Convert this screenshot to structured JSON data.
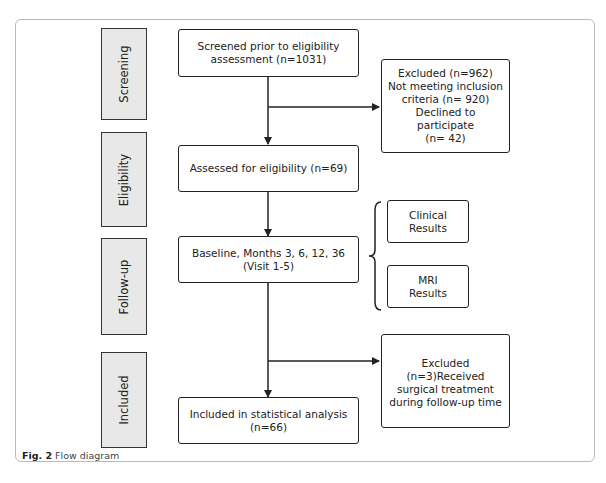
{
  "stages": [
    {
      "label": "Screening"
    },
    {
      "label": "Eligibility"
    },
    {
      "label": "Follow-up"
    },
    {
      "label": "Included"
    }
  ],
  "boxes": {
    "screened": "Screened prior to eligibility\nassessment (n=1031)",
    "excluded1": "Excluded (n=962)\nNot meeting inclusion\ncriteria (n= 920)\nDeclined to participate\n(n= 42)",
    "assessed": "Assessed for eligibility (n=69)",
    "baseline": "Baseline, Months 3, 6, 12, 36\n(Visit 1-5)",
    "clinical": "Clinical\nResults",
    "mri": "MRI\nResults",
    "excluded2": "Excluded (n=3)Received\nsurgical treatment\nduring follow-up time",
    "included": "Included in statistical analysis\n(n=66)"
  },
  "caption": {
    "label": "Fig. 2",
    "text": " Flow diagram"
  }
}
